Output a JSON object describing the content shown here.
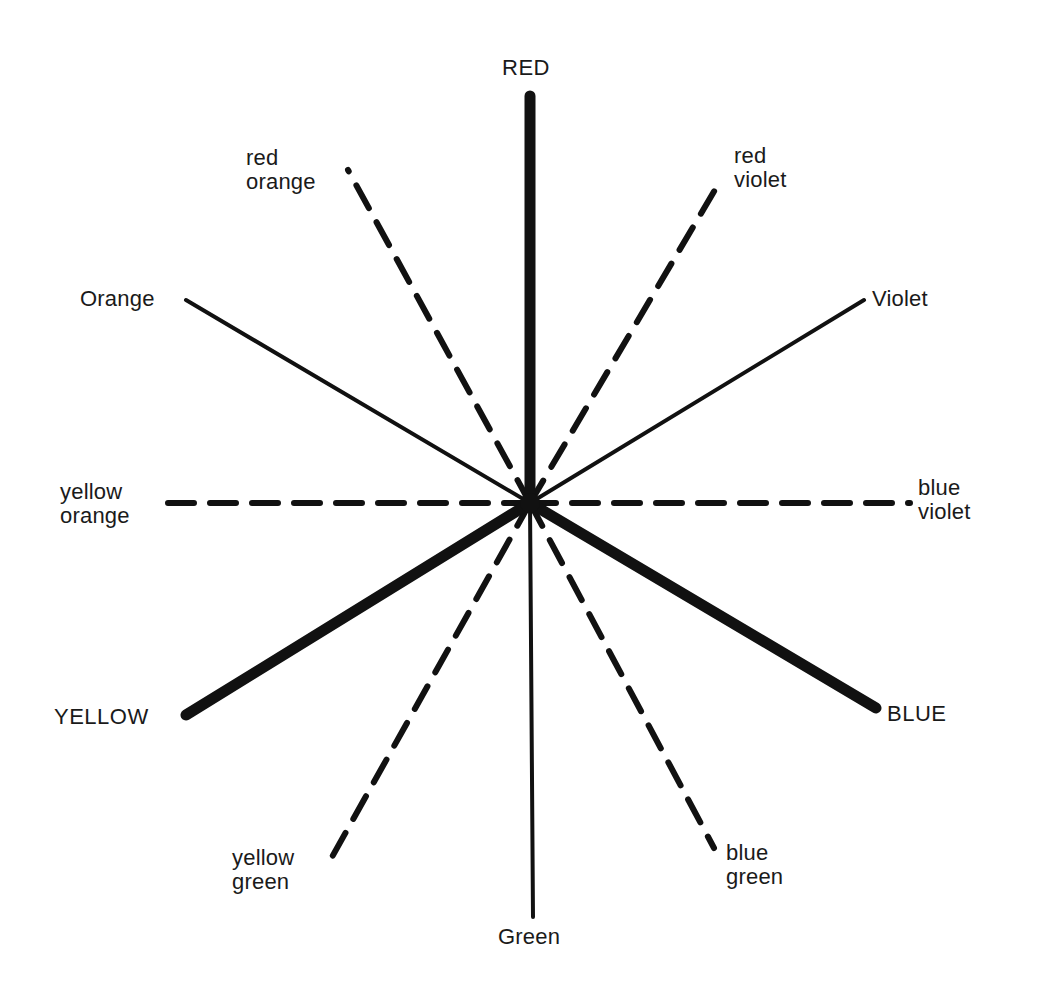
{
  "diagram": {
    "title": "",
    "type": "color-wheel-spokes",
    "center": {
      "x": 530,
      "y": 503
    },
    "stroke_color": "#111111",
    "background": "#ffffff",
    "spokes": [
      {
        "id": "red",
        "label_lines": [
          "RED"
        ],
        "category": "primary",
        "style": "solid",
        "weight": "heavy",
        "x2": 530,
        "y2": 96
      },
      {
        "id": "red-violet",
        "label_lines": [
          "red",
          "violet"
        ],
        "category": "tertiary",
        "style": "dashed",
        "weight": "medium",
        "x2": 722,
        "y2": 178
      },
      {
        "id": "violet",
        "label_lines": [
          "Violet"
        ],
        "category": "secondary",
        "style": "solid",
        "weight": "light",
        "x2": 864,
        "y2": 300
      },
      {
        "id": "blue-violet",
        "label_lines": [
          "blue",
          "violet"
        ],
        "category": "tertiary",
        "style": "dashed",
        "weight": "medium",
        "x2": 910,
        "y2": 503
      },
      {
        "id": "blue",
        "label_lines": [
          "BLUE"
        ],
        "category": "primary",
        "style": "solid",
        "weight": "heavy",
        "x2": 876,
        "y2": 708
      },
      {
        "id": "blue-green",
        "label_lines": [
          "blue",
          "green"
        ],
        "category": "tertiary",
        "style": "dashed",
        "weight": "medium",
        "x2": 714,
        "y2": 848
      },
      {
        "id": "green",
        "label_lines": [
          "Green"
        ],
        "category": "secondary",
        "style": "solid",
        "weight": "light",
        "x2": 533,
        "y2": 917
      },
      {
        "id": "yellow-green",
        "label_lines": [
          "yellow",
          "green"
        ],
        "category": "tertiary",
        "style": "dashed",
        "weight": "medium",
        "x2": 332,
        "y2": 857
      },
      {
        "id": "yellow",
        "label_lines": [
          "YELLOW"
        ],
        "category": "primary",
        "style": "solid",
        "weight": "heavy",
        "x2": 186,
        "y2": 715
      },
      {
        "id": "yellow-orange",
        "label_lines": [
          "yellow",
          "orange"
        ],
        "category": "tertiary",
        "style": "dashed",
        "weight": "medium",
        "x2": 155,
        "y2": 503
      },
      {
        "id": "orange",
        "label_lines": [
          "Orange"
        ],
        "category": "secondary",
        "style": "solid",
        "weight": "light",
        "x2": 186,
        "y2": 300
      },
      {
        "id": "red-orange",
        "label_lines": [
          "red",
          "orange"
        ],
        "category": "tertiary",
        "style": "dashed",
        "weight": "medium",
        "x2": 348,
        "y2": 170
      }
    ],
    "labels": {
      "red": {
        "lines": [
          "RED"
        ],
        "x": 502,
        "y": 56,
        "align": "left"
      },
      "red_violet": {
        "lines": [
          "red",
          "violet"
        ],
        "x": 734,
        "y": 144,
        "align": "left"
      },
      "violet": {
        "lines": [
          "Violet"
        ],
        "x": 872,
        "y": 287,
        "align": "left"
      },
      "blue_violet": {
        "lines": [
          "blue",
          "violet"
        ],
        "x": 918,
        "y": 476,
        "align": "left"
      },
      "blue": {
        "lines": [
          "BLUE"
        ],
        "x": 887,
        "y": 702,
        "align": "left"
      },
      "blue_green": {
        "lines": [
          "blue",
          "green"
        ],
        "x": 726,
        "y": 841,
        "align": "left"
      },
      "green": {
        "lines": [
          "Green"
        ],
        "x": 498,
        "y": 925,
        "align": "left"
      },
      "yellow_green": {
        "lines": [
          "yellow",
          "green"
        ],
        "x": 232,
        "y": 846,
        "align": "left"
      },
      "yellow": {
        "lines": [
          "YELLOW"
        ],
        "x": 54,
        "y": 705,
        "align": "left"
      },
      "yellow_orange": {
        "lines": [
          "yellow",
          "orange"
        ],
        "x": 60,
        "y": 480,
        "align": "left"
      },
      "orange": {
        "lines": [
          "Orange"
        ],
        "x": 80,
        "y": 287,
        "align": "left"
      },
      "red_orange": {
        "lines": [
          "red",
          "orange"
        ],
        "x": 246,
        "y": 146,
        "align": "left"
      }
    },
    "stroke_widths": {
      "heavy": 11,
      "medium": 6,
      "light": 4
    },
    "dash_pattern": "26 16"
  }
}
